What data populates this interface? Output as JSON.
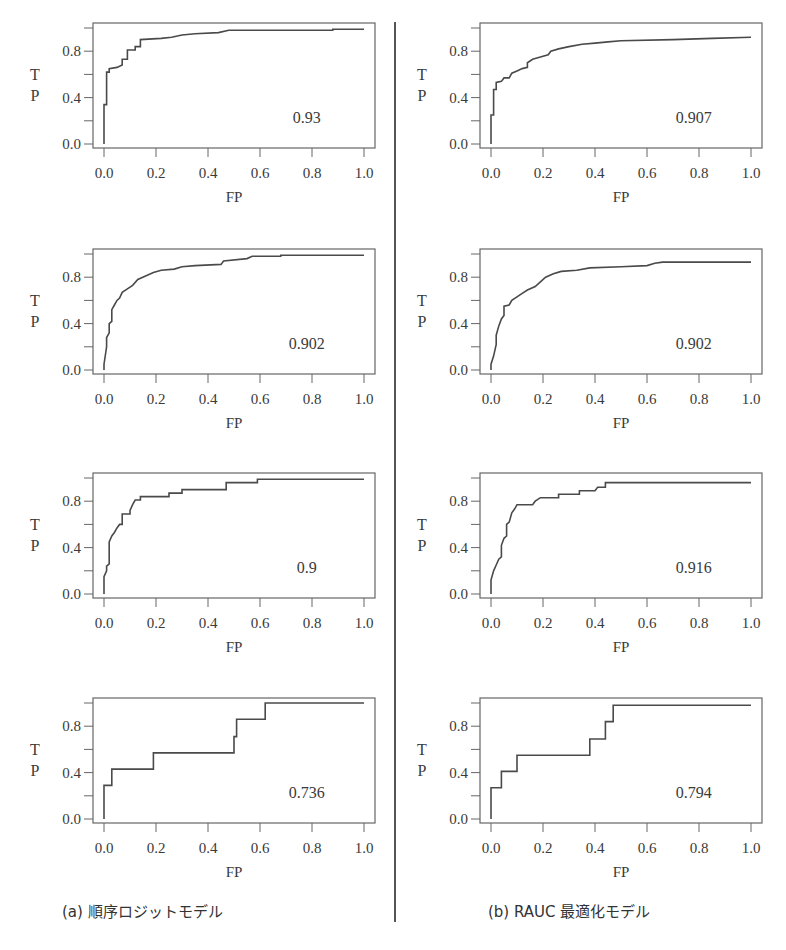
{
  "figure": {
    "captions": [
      "(a) 順序ロジットモデル",
      "(b) RAUC 最適化モデル"
    ],
    "line_color": "#4a4a4a"
  },
  "chart_data": [
    {
      "type": "line",
      "column": "a",
      "row": 1,
      "xlabel": "FP",
      "ylabel": "T\nP",
      "annotation": "0.93",
      "xlim": [
        0,
        1
      ],
      "ylim": [
        0,
        1
      ],
      "xticks": [
        "0.0",
        "0.2",
        "0.4",
        "0.6",
        "0.8",
        "1.0"
      ],
      "yticks": [
        "0.0",
        "0.4",
        "0.8"
      ],
      "points": [
        [
          0,
          0
        ],
        [
          0,
          0.34
        ],
        [
          0.01,
          0.34
        ],
        [
          0.01,
          0.62
        ],
        [
          0.02,
          0.62
        ],
        [
          0.02,
          0.65
        ],
        [
          0.05,
          0.66
        ],
        [
          0.07,
          0.68
        ],
        [
          0.07,
          0.73
        ],
        [
          0.09,
          0.73
        ],
        [
          0.09,
          0.81
        ],
        [
          0.12,
          0.81
        ],
        [
          0.12,
          0.84
        ],
        [
          0.14,
          0.84
        ],
        [
          0.14,
          0.9
        ],
        [
          0.22,
          0.91
        ],
        [
          0.26,
          0.92
        ],
        [
          0.3,
          0.94
        ],
        [
          0.35,
          0.95
        ],
        [
          0.44,
          0.96
        ],
        [
          0.48,
          0.98
        ],
        [
          0.7,
          0.98
        ],
        [
          0.88,
          0.98
        ],
        [
          0.88,
          0.99
        ],
        [
          1.0,
          0.99
        ]
      ]
    },
    {
      "type": "line",
      "column": "b",
      "row": 1,
      "xlabel": "FP",
      "ylabel": "T\nP",
      "annotation": "0.907",
      "xlim": [
        0,
        1
      ],
      "ylim": [
        0,
        1
      ],
      "xticks": [
        "0.0",
        "0.2",
        "0.4",
        "0.6",
        "0.8",
        "1.0"
      ],
      "yticks": [
        "0.0",
        "0.4",
        "0.8"
      ],
      "points": [
        [
          0,
          0
        ],
        [
          0,
          0.25
        ],
        [
          0.01,
          0.25
        ],
        [
          0.01,
          0.47
        ],
        [
          0.02,
          0.47
        ],
        [
          0.02,
          0.53
        ],
        [
          0.04,
          0.54
        ],
        [
          0.05,
          0.57
        ],
        [
          0.07,
          0.57
        ],
        [
          0.08,
          0.61
        ],
        [
          0.1,
          0.63
        ],
        [
          0.12,
          0.65
        ],
        [
          0.14,
          0.66
        ],
        [
          0.14,
          0.7
        ],
        [
          0.16,
          0.73
        ],
        [
          0.19,
          0.75
        ],
        [
          0.22,
          0.77
        ],
        [
          0.23,
          0.8
        ],
        [
          0.26,
          0.82
        ],
        [
          0.3,
          0.84
        ],
        [
          0.35,
          0.86
        ],
        [
          0.4,
          0.87
        ],
        [
          0.45,
          0.88
        ],
        [
          0.5,
          0.89
        ],
        [
          0.7,
          0.9
        ],
        [
          0.85,
          0.91
        ],
        [
          1.0,
          0.92
        ]
      ]
    },
    {
      "type": "line",
      "column": "a",
      "row": 2,
      "xlabel": "FP",
      "ylabel": "T\nP",
      "annotation": "0.902",
      "xlim": [
        0,
        1
      ],
      "ylim": [
        0,
        1
      ],
      "xticks": [
        "0.0",
        "0.2",
        "0.4",
        "0.6",
        "0.8",
        "1.0"
      ],
      "yticks": [
        "0.0",
        "0.4",
        "0.8"
      ],
      "points": [
        [
          0,
          0
        ],
        [
          0,
          0.05
        ],
        [
          0.01,
          0.2
        ],
        [
          0.01,
          0.28
        ],
        [
          0.02,
          0.32
        ],
        [
          0.02,
          0.4
        ],
        [
          0.03,
          0.42
        ],
        [
          0.03,
          0.52
        ],
        [
          0.04,
          0.56
        ],
        [
          0.05,
          0.6
        ],
        [
          0.06,
          0.62
        ],
        [
          0.07,
          0.67
        ],
        [
          0.09,
          0.7
        ],
        [
          0.11,
          0.73
        ],
        [
          0.13,
          0.78
        ],
        [
          0.16,
          0.81
        ],
        [
          0.19,
          0.84
        ],
        [
          0.22,
          0.86
        ],
        [
          0.27,
          0.87
        ],
        [
          0.3,
          0.89
        ],
        [
          0.35,
          0.9
        ],
        [
          0.45,
          0.91
        ],
        [
          0.46,
          0.94
        ],
        [
          0.55,
          0.96
        ],
        [
          0.57,
          0.98
        ],
        [
          0.68,
          0.98
        ],
        [
          0.68,
          0.99
        ],
        [
          1.0,
          0.99
        ]
      ]
    },
    {
      "type": "line",
      "column": "b",
      "row": 2,
      "xlabel": "FP",
      "ylabel": "T\nP",
      "annotation": "0.902",
      "xlim": [
        0,
        1
      ],
      "ylim": [
        0,
        1
      ],
      "xticks": [
        "0.0",
        "0.2",
        "0.4",
        "0.6",
        "0.8",
        "1.0"
      ],
      "yticks": [
        "0.0",
        "0.4",
        "0.8"
      ],
      "points": [
        [
          0,
          0
        ],
        [
          0,
          0.05
        ],
        [
          0.01,
          0.12
        ],
        [
          0.02,
          0.22
        ],
        [
          0.02,
          0.3
        ],
        [
          0.03,
          0.38
        ],
        [
          0.04,
          0.44
        ],
        [
          0.05,
          0.47
        ],
        [
          0.05,
          0.55
        ],
        [
          0.07,
          0.56
        ],
        [
          0.08,
          0.6
        ],
        [
          0.1,
          0.63
        ],
        [
          0.12,
          0.66
        ],
        [
          0.14,
          0.69
        ],
        [
          0.17,
          0.72
        ],
        [
          0.19,
          0.76
        ],
        [
          0.21,
          0.8
        ],
        [
          0.24,
          0.83
        ],
        [
          0.27,
          0.85
        ],
        [
          0.33,
          0.86
        ],
        [
          0.38,
          0.88
        ],
        [
          0.5,
          0.89
        ],
        [
          0.6,
          0.9
        ],
        [
          0.63,
          0.92
        ],
        [
          0.66,
          0.93
        ],
        [
          1.0,
          0.93
        ]
      ]
    },
    {
      "type": "line",
      "column": "a",
      "row": 3,
      "xlabel": "FP",
      "ylabel": "T\nP",
      "annotation": "0.9",
      "xlim": [
        0,
        1
      ],
      "ylim": [
        0,
        1
      ],
      "xticks": [
        "0.0",
        "0.2",
        "0.4",
        "0.6",
        "0.8",
        "1.0"
      ],
      "yticks": [
        "0.0",
        "0.4",
        "0.8"
      ],
      "points": [
        [
          0,
          0
        ],
        [
          0,
          0.15
        ],
        [
          0.01,
          0.2
        ],
        [
          0.01,
          0.24
        ],
        [
          0.02,
          0.26
        ],
        [
          0.02,
          0.35
        ],
        [
          0.02,
          0.45
        ],
        [
          0.03,
          0.5
        ],
        [
          0.04,
          0.53
        ],
        [
          0.05,
          0.57
        ],
        [
          0.06,
          0.6
        ],
        [
          0.07,
          0.6
        ],
        [
          0.07,
          0.69
        ],
        [
          0.1,
          0.69
        ],
        [
          0.1,
          0.72
        ],
        [
          0.11,
          0.77
        ],
        [
          0.12,
          0.81
        ],
        [
          0.14,
          0.81
        ],
        [
          0.14,
          0.84
        ],
        [
          0.25,
          0.84
        ],
        [
          0.25,
          0.87
        ],
        [
          0.3,
          0.87
        ],
        [
          0.3,
          0.9
        ],
        [
          0.47,
          0.9
        ],
        [
          0.47,
          0.96
        ],
        [
          0.59,
          0.96
        ],
        [
          0.59,
          0.99
        ],
        [
          1.0,
          0.99
        ]
      ]
    },
    {
      "type": "line",
      "column": "b",
      "row": 3,
      "xlabel": "FP",
      "ylabel": "T\nP",
      "annotation": "0.916",
      "xlim": [
        0,
        1
      ],
      "ylim": [
        0,
        1
      ],
      "xticks": [
        "0.0",
        "0.2",
        "0.4",
        "0.6",
        "0.8",
        "1.0"
      ],
      "yticks": [
        "0.0",
        "0.4",
        "0.8"
      ],
      "points": [
        [
          0,
          0
        ],
        [
          0,
          0.12
        ],
        [
          0.01,
          0.2
        ],
        [
          0.02,
          0.25
        ],
        [
          0.03,
          0.3
        ],
        [
          0.04,
          0.32
        ],
        [
          0.04,
          0.42
        ],
        [
          0.05,
          0.48
        ],
        [
          0.06,
          0.5
        ],
        [
          0.06,
          0.6
        ],
        [
          0.07,
          0.62
        ],
        [
          0.08,
          0.7
        ],
        [
          0.09,
          0.73
        ],
        [
          0.1,
          0.77
        ],
        [
          0.16,
          0.77
        ],
        [
          0.17,
          0.8
        ],
        [
          0.19,
          0.83
        ],
        [
          0.26,
          0.83
        ],
        [
          0.26,
          0.86
        ],
        [
          0.34,
          0.86
        ],
        [
          0.34,
          0.89
        ],
        [
          0.4,
          0.89
        ],
        [
          0.41,
          0.92
        ],
        [
          0.44,
          0.92
        ],
        [
          0.44,
          0.96
        ],
        [
          1.0,
          0.96
        ]
      ]
    },
    {
      "type": "line",
      "column": "a",
      "row": 4,
      "xlabel": "FP",
      "ylabel": "T\nP",
      "annotation": "0.736",
      "xlim": [
        0,
        1
      ],
      "ylim": [
        0,
        1
      ],
      "xticks": [
        "0.0",
        "0.2",
        "0.4",
        "0.6",
        "0.8",
        "1.0"
      ],
      "yticks": [
        "0.0",
        "0.4",
        "0.8"
      ],
      "points": [
        [
          0,
          0
        ],
        [
          0,
          0.29
        ],
        [
          0.03,
          0.29
        ],
        [
          0.03,
          0.43
        ],
        [
          0.19,
          0.43
        ],
        [
          0.19,
          0.57
        ],
        [
          0.5,
          0.57
        ],
        [
          0.5,
          0.71
        ],
        [
          0.51,
          0.71
        ],
        [
          0.51,
          0.86
        ],
        [
          0.62,
          0.86
        ],
        [
          0.62,
          1.0
        ],
        [
          1.0,
          1.0
        ]
      ]
    },
    {
      "type": "line",
      "column": "b",
      "row": 4,
      "xlabel": "FP",
      "ylabel": "T\nP",
      "annotation": "0.794",
      "xlim": [
        0,
        1
      ],
      "ylim": [
        0,
        1
      ],
      "xticks": [
        "0.0",
        "0.2",
        "0.4",
        "0.6",
        "0.8",
        "1.0"
      ],
      "yticks": [
        "0.0",
        "0.4",
        "0.8"
      ],
      "points": [
        [
          0,
          0
        ],
        [
          0,
          0.27
        ],
        [
          0.04,
          0.27
        ],
        [
          0.04,
          0.41
        ],
        [
          0.1,
          0.41
        ],
        [
          0.1,
          0.55
        ],
        [
          0.38,
          0.55
        ],
        [
          0.38,
          0.69
        ],
        [
          0.44,
          0.69
        ],
        [
          0.44,
          0.84
        ],
        [
          0.47,
          0.84
        ],
        [
          0.47,
          0.98
        ],
        [
          1.0,
          0.98
        ]
      ]
    }
  ]
}
